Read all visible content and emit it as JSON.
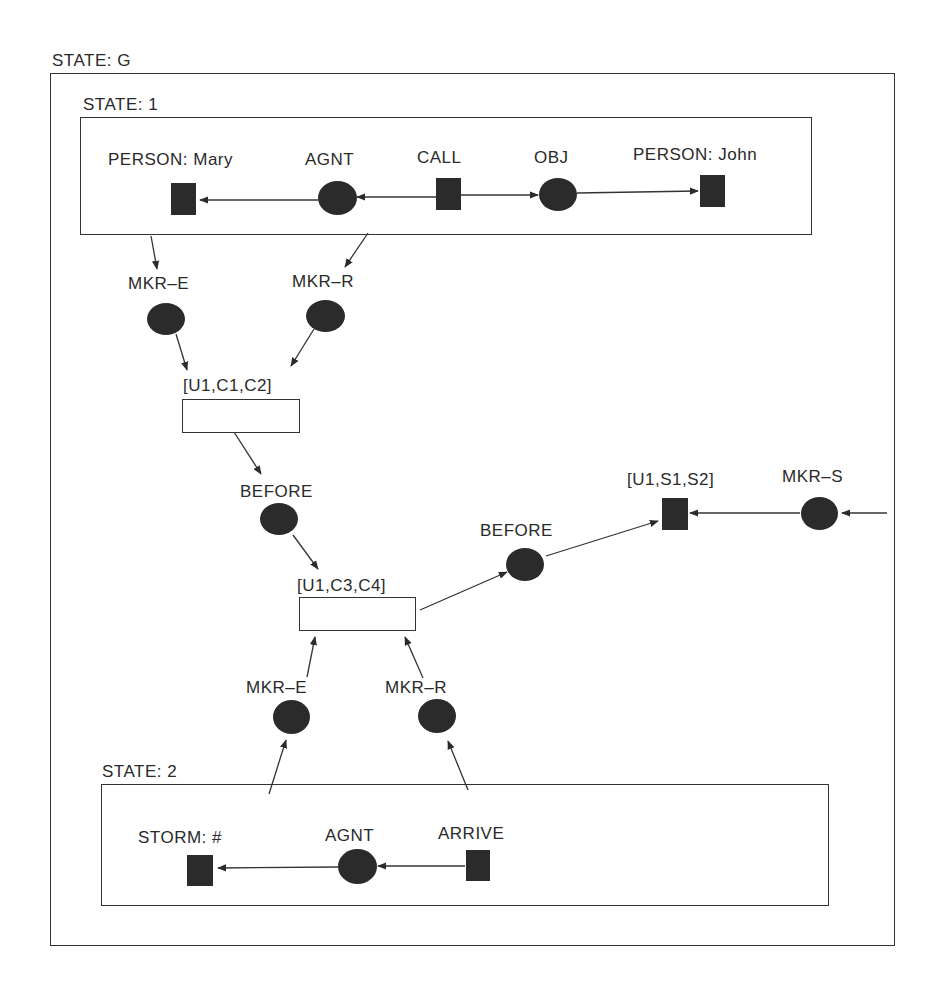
{
  "diagram": {
    "outer_context": {
      "label": "STATE: G"
    },
    "state1": {
      "label": "STATE: 1",
      "nodes": {
        "mary": "PERSON: Mary",
        "agnt": "AGNT",
        "call": "CALL",
        "obj": "OBJ",
        "john": "PERSON: John"
      }
    },
    "middle": {
      "mkr_e_top": "MKR–E",
      "mkr_r_top": "MKR–R",
      "u1c1c2": "[U1,C1,C2]",
      "before_1": "BEFORE",
      "u1c3c4": "[U1,C3,C4]",
      "before_2": "BEFORE",
      "u1s1s2": "[U1,S1,S2]",
      "mkr_s": "MKR–S",
      "mkr_e_bottom": "MKR–E",
      "mkr_r_bottom": "MKR–R"
    },
    "state2": {
      "label": "STATE: 2",
      "nodes": {
        "storm": "STORM: #",
        "agnt": "AGNT",
        "arrive": "ARRIVE"
      }
    },
    "colors": {
      "ink": "#2b2b2b",
      "line": "#333333",
      "background": "#ffffff"
    }
  }
}
